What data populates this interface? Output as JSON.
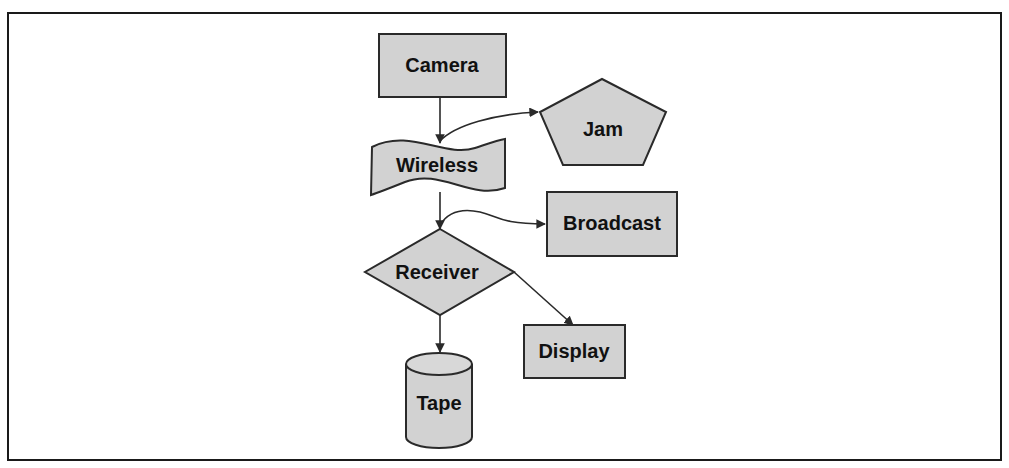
{
  "caption": "Figure: Data flow diagram",
  "diagram": {
    "type": "flowchart",
    "fill_color": "#d2d2d2",
    "stroke_color": "#2a2a2a",
    "nodes": [
      {
        "id": "camera",
        "label": "Camera",
        "shape": "rectangle"
      },
      {
        "id": "wireless",
        "label": "Wireless",
        "shape": "wave"
      },
      {
        "id": "jam",
        "label": "Jam",
        "shape": "pentagon"
      },
      {
        "id": "broadcast",
        "label": "Broadcast",
        "shape": "rectangle"
      },
      {
        "id": "receiver",
        "label": "Receiver",
        "shape": "diamond"
      },
      {
        "id": "display",
        "label": "Display",
        "shape": "rectangle"
      },
      {
        "id": "tape",
        "label": "Tape",
        "shape": "cylinder"
      }
    ],
    "edges": [
      {
        "from": "camera",
        "to": "wireless"
      },
      {
        "from": "wireless",
        "to": "jam"
      },
      {
        "from": "wireless",
        "to": "receiver"
      },
      {
        "from": "wireless",
        "to": "broadcast"
      },
      {
        "from": "receiver",
        "to": "display"
      },
      {
        "from": "receiver",
        "to": "tape"
      }
    ]
  }
}
